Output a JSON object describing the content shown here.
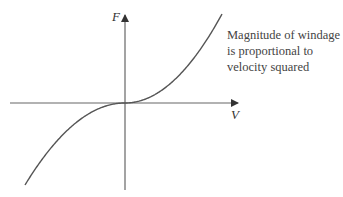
{
  "diagram": {
    "y_axis_label": "F",
    "x_axis_label": "V",
    "annotation_lines": [
      "Magnitude of windage",
      "is proportional to",
      "velocity squared"
    ],
    "curve": "signed quadratic F = V|V| (cubic-like shape through origin)",
    "colors": {
      "axis": "#555555",
      "curve": "#555555",
      "text": "#444444"
    }
  }
}
